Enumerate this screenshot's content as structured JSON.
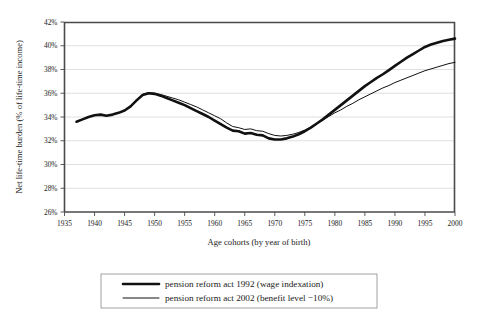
{
  "chart_data": {
    "type": "line",
    "title": "",
    "xlabel": "Age cohorts (by year of birth)",
    "ylabel": "Net life-time burden (% of life-time income)",
    "xlim": [
      1935,
      2000
    ],
    "ylim": [
      26,
      42
    ],
    "ytick_step": 2,
    "xtick_step": 5,
    "grid": true,
    "legend_position": "below-plot",
    "x_tick_labels": [
      "1935",
      "1940",
      "1945",
      "1950",
      "1955",
      "1960",
      "1965",
      "1970",
      "1975",
      "1980",
      "1985",
      "1990",
      "1995",
      "2000"
    ],
    "y_tick_labels": [
      "26%",
      "28%",
      "30%",
      "32%",
      "34%",
      "36%",
      "38%",
      "40%",
      "42%"
    ],
    "x": [
      1937,
      1938,
      1939,
      1940,
      1941,
      1942,
      1943,
      1944,
      1945,
      1946,
      1947,
      1948,
      1949,
      1950,
      1951,
      1952,
      1953,
      1954,
      1955,
      1956,
      1957,
      1958,
      1959,
      1960,
      1961,
      1962,
      1963,
      1964,
      1965,
      1966,
      1967,
      1968,
      1969,
      1970,
      1971,
      1972,
      1973,
      1974,
      1975,
      1976,
      1977,
      1978,
      1979,
      1980,
      1981,
      1982,
      1983,
      1984,
      1985,
      1986,
      1987,
      1988,
      1989,
      1990,
      1991,
      1992,
      1993,
      1994,
      1995,
      1996,
      1997,
      1998,
      1999,
      2000
    ],
    "series": [
      {
        "name": "pension reform act 1992 (wage indexation)",
        "style": "thick",
        "values": [
          33.6,
          33.8,
          34.0,
          34.15,
          34.2,
          34.1,
          34.2,
          34.35,
          34.55,
          34.9,
          35.4,
          35.85,
          36.0,
          35.95,
          35.8,
          35.6,
          35.4,
          35.2,
          35.0,
          34.75,
          34.5,
          34.25,
          34.0,
          33.7,
          33.4,
          33.1,
          32.85,
          32.8,
          32.6,
          32.65,
          32.5,
          32.45,
          32.2,
          32.1,
          32.1,
          32.2,
          32.35,
          32.55,
          32.8,
          33.1,
          33.45,
          33.8,
          34.2,
          34.6,
          35.0,
          35.4,
          35.8,
          36.2,
          36.6,
          36.95,
          37.3,
          37.6,
          37.95,
          38.3,
          38.65,
          39.0,
          39.3,
          39.6,
          39.9,
          40.1,
          40.25,
          40.4,
          40.5,
          40.6
        ]
      },
      {
        "name": "pension reform act 2002 (benefit level −10%)",
        "style": "thin",
        "values": [
          33.6,
          33.8,
          34.0,
          34.15,
          34.2,
          34.1,
          34.2,
          34.35,
          34.55,
          34.9,
          35.4,
          35.9,
          36.05,
          36.0,
          35.9,
          35.75,
          35.6,
          35.45,
          35.25,
          35.05,
          34.85,
          34.6,
          34.35,
          34.1,
          33.85,
          33.5,
          33.2,
          33.1,
          32.95,
          33.0,
          32.85,
          32.8,
          32.6,
          32.45,
          32.4,
          32.45,
          32.55,
          32.7,
          32.9,
          33.15,
          33.45,
          33.75,
          34.05,
          34.35,
          34.6,
          34.9,
          35.15,
          35.45,
          35.7,
          35.95,
          36.2,
          36.45,
          36.65,
          36.9,
          37.1,
          37.3,
          37.5,
          37.7,
          37.9,
          38.05,
          38.2,
          38.35,
          38.5,
          38.6
        ]
      }
    ],
    "legend": [
      {
        "label": "pension reform act 1992 (wage indexation)",
        "style": "thick"
      },
      {
        "label": "pension reform act 2002 (benefit level −10%)",
        "style": "thin"
      }
    ],
    "colors": {
      "series": "#111111",
      "grid": "#c9c9c9",
      "axis": "#4a4a4a",
      "background": "#ffffff"
    }
  }
}
